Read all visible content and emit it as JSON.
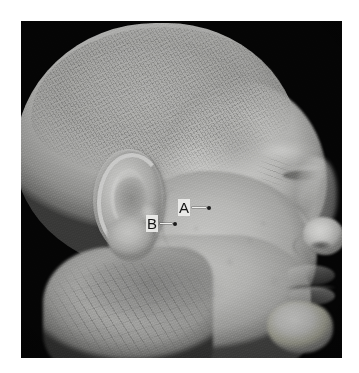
{
  "figure": {
    "kind": "clinical-profile-photograph",
    "view": "right lateral head and neck profile",
    "color_mode": "grayscale",
    "canvas": {
      "width": 359,
      "height": 373,
      "background": "#ffffff"
    },
    "photo_plate": {
      "x": 21,
      "y": 21,
      "width": 321,
      "height": 337,
      "background": "#050505",
      "description": "black studio background behind the head"
    }
  },
  "palette": {
    "page_background": "#ffffff",
    "photo_background": "#050505",
    "skin_highlight": "#cfcfcd",
    "skin_midtone": "#b0b0ae",
    "skin_shadow": "#7c7c7a",
    "annotation_text": "#151515",
    "annotation_halo": "#eeeeec",
    "annotation_marker": "#1a1a1a"
  },
  "annotations": {
    "count": 2,
    "style": "letter label with horizontal leader line terminating in a small dark point marker",
    "items": [
      {
        "id": "a",
        "label": "A",
        "x": 157,
        "y": 178,
        "leader_length": 14,
        "points_to": "preauricular cheek point anterior to the ear",
        "marker_color": "#1a1a1a"
      },
      {
        "id": "b",
        "label": "B",
        "x": 125,
        "y": 194,
        "leader_length": 12,
        "points_to": "point just anterior to the tragus of the ear",
        "marker_color": "#1a1a1a"
      }
    ]
  },
  "anatomy_regions": [
    {
      "name": "cranium",
      "label": "scalp with short clipped hair"
    },
    {
      "name": "auricle",
      "label": "ear"
    },
    {
      "name": "helix",
      "label": "helix of ear"
    },
    {
      "name": "concha",
      "label": "concha"
    },
    {
      "name": "lobule",
      "label": "ear lobe"
    },
    {
      "name": "tragus",
      "label": "tragus"
    },
    {
      "name": "temple",
      "label": "temple"
    },
    {
      "name": "orbit",
      "label": "eye region"
    },
    {
      "name": "nose",
      "label": "nose"
    },
    {
      "name": "lips",
      "label": "lips"
    },
    {
      "name": "chin",
      "label": "chin"
    },
    {
      "name": "neck",
      "label": "neck"
    },
    {
      "name": "cheek",
      "label": "cheek"
    }
  ]
}
